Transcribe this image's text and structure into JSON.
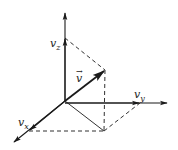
{
  "diagram": {
    "title": "",
    "origin": [
      65,
      101
    ],
    "axes": {
      "z_tip": [
        65,
        12
      ],
      "y_tip": [
        168,
        103
      ],
      "x_tip": [
        13,
        143
      ]
    },
    "components": {
      "vz_tip": [
        65,
        38
      ],
      "vy_tip": [
        140,
        103
      ],
      "vx_tip": [
        29,
        131
      ]
    },
    "vector_tip": [
      105,
      70
    ],
    "base_corner": [
      104,
      131
    ],
    "labels": {
      "vector": "v",
      "vector_arrow": "→",
      "vz": {
        "main": "v",
        "sub": "z"
      },
      "vy": {
        "main": "v",
        "sub": "y"
      },
      "vx": {
        "main": "v",
        "sub": "x"
      }
    },
    "colors": {
      "line": "#1a1a1a",
      "background": "#ffffff"
    }
  }
}
